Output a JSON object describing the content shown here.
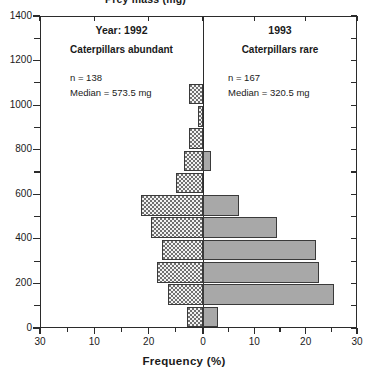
{
  "figure": {
    "clipped_top_label": "Prey mass (mg)",
    "x_axis_title": "Frequency (%)",
    "y_axis_title": "Prey mass (mg)"
  },
  "panels": {
    "left": {
      "title": "Year: 1992",
      "subtitle": "Caterpillars abundant",
      "n_label": "n = 138",
      "median_label": "Median = 573.5 mg",
      "fill": "#f2f2f2",
      "pattern": "stipple"
    },
    "right": {
      "title": "1993",
      "subtitle": "Caterpillars rare",
      "n_label": "n = 167",
      "median_label": "Median = 320.5 mg",
      "fill": "#a8a8a8",
      "pattern": "solid"
    }
  },
  "axes": {
    "y_ticks_major": [
      0,
      200,
      400,
      600,
      800,
      1000,
      1200,
      1400
    ],
    "y_ticks_minor": [
      100,
      300,
      500,
      700,
      900,
      1100,
      1300
    ],
    "y_min": 0,
    "y_max": 1400,
    "x_tick_labels": [
      "30",
      "10",
      "20",
      "0",
      "10",
      "20",
      "30"
    ],
    "x_tick_values": [
      30,
      20,
      10,
      0,
      10,
      20,
      30
    ],
    "x_max_each_side": 30,
    "x_minor_step": 5
  },
  "chart_data": {
    "type": "bar",
    "title": "",
    "subtitle": "",
    "xlabel": "Frequency (%)",
    "ylabel": "Prey mass (mg)",
    "orientation": "horizontal-back-to-back",
    "xlim": [
      -30,
      30
    ],
    "ylim": [
      0,
      1400
    ],
    "grid": false,
    "legend_position": "none",
    "bin_width": 100,
    "categories": [
      "0-100",
      "100-200",
      "200-300",
      "300-400",
      "400-500",
      "500-600",
      "600-700",
      "700-800",
      "800-900",
      "900-1000",
      "1000-1100",
      "1100-1200",
      "1200-1300",
      "1300-1400"
    ],
    "bin_centers": [
      50,
      150,
      250,
      350,
      450,
      550,
      650,
      750,
      850,
      950,
      1050,
      1150,
      1250,
      1350
    ],
    "series": [
      {
        "name": "Year: 1992 (Caterpillars abundant)",
        "side": "left",
        "color": "#f2f2f2",
        "n": 138,
        "median_mg": 573.5,
        "values": [
          3.0,
          6.5,
          8.5,
          7.5,
          9.5,
          11.5,
          5.0,
          3.5,
          2.5,
          1.0,
          2.5,
          0.0,
          0.0,
          0.0
        ]
      },
      {
        "name": "1993 (Caterpillars rare)",
        "side": "right",
        "color": "#a8a8a8",
        "n": 167,
        "median_mg": 320.5,
        "values": [
          3.0,
          25.5,
          22.5,
          22.0,
          14.5,
          7.0,
          0.0,
          1.5,
          0.0,
          0.0,
          0.0,
          0.0,
          0.0,
          0.0
        ]
      }
    ],
    "annotations": [
      {
        "text": "Year: 1992",
        "panel": "left"
      },
      {
        "text": "Caterpillars abundant",
        "panel": "left"
      },
      {
        "text": "n = 138",
        "panel": "left"
      },
      {
        "text": "Median = 573.5 mg",
        "panel": "left"
      },
      {
        "text": "1993",
        "panel": "right"
      },
      {
        "text": "Caterpillars rare",
        "panel": "right"
      },
      {
        "text": "n = 167",
        "panel": "right"
      },
      {
        "text": "Median = 320.5 mg",
        "panel": "right"
      }
    ]
  }
}
